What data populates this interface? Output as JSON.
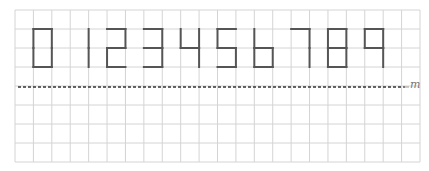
{
  "figure": {
    "digits": [
      "0",
      "1",
      "2",
      "3",
      "4",
      "5",
      "6",
      "7",
      "8",
      "9"
    ],
    "mirror_line_label": "m",
    "colors": {
      "grid": "#d4d4d4",
      "digit_stroke": "#555555",
      "dashed_line": "#333333",
      "label": "#777777"
    },
    "grid": {
      "columns": 22,
      "rows": 8
    }
  }
}
